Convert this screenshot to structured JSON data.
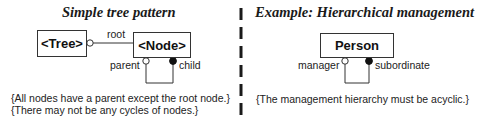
{
  "left_panel": {
    "title": "Simple tree pattern",
    "classes": {
      "tree": "<Tree>",
      "node": "<Node>"
    },
    "association": {
      "root_role": "root"
    },
    "self_association": {
      "parent_role": "parent",
      "child_role": "child"
    },
    "constraints": [
      "{All nodes have a parent except the root node.}",
      "{There may not be any cycles of nodes.}"
    ]
  },
  "right_panel": {
    "title": "Example: Hierarchical management",
    "classes": {
      "person": "Person"
    },
    "self_association": {
      "manager_role": "manager",
      "subordinate_role": "subordinate"
    },
    "constraints": [
      "{The management hierarchy must be acyclic.}"
    ]
  },
  "colors": {
    "line": "#333333",
    "divider": "#1a1a1a",
    "background": "#ffffff"
  },
  "icons": {
    "optional_end": "hollow-circle",
    "many_end": "filled-circle"
  }
}
